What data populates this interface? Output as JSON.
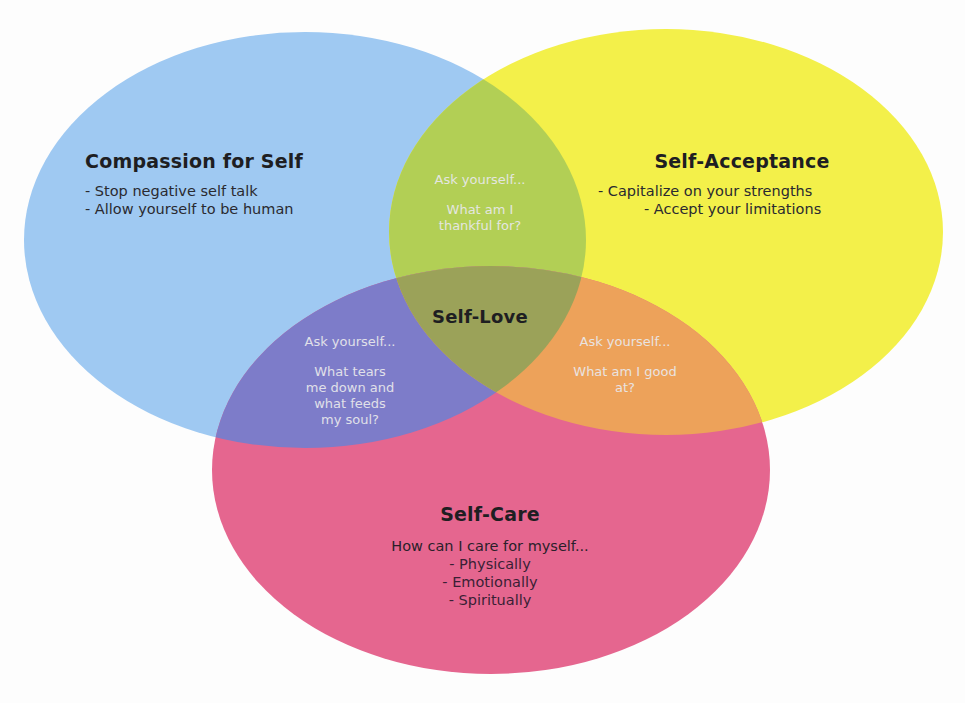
{
  "colors": {
    "background": "#fdfdfd",
    "compassion": "#9fc9f2",
    "acceptance": "#f3f04a",
    "care": "#e5668f",
    "compassion_acceptance": "#b2cf55",
    "compassion_care": "#7d7cc9",
    "acceptance_care": "#eda25a",
    "center": "#9ba259"
  },
  "sets": {
    "compassion": {
      "title": "Compassion for Self",
      "items": [
        "- Stop negative self talk",
        "- Allow yourself to be human"
      ]
    },
    "acceptance": {
      "title": "Self-Acceptance",
      "items": [
        "- Capitalize on your strengths",
        "- Accept your limitations"
      ]
    },
    "care": {
      "title": "Self-Care",
      "lead": "How can I care for myself...",
      "items": [
        "- Physically",
        "- Emotionally",
        "- Spiritually"
      ]
    }
  },
  "intersections": {
    "compassion_acceptance": {
      "prompt": "Ask yourself...",
      "question_lines": [
        "What am I",
        "thankful for?"
      ]
    },
    "compassion_care": {
      "prompt": "Ask yourself...",
      "question_lines": [
        "What tears",
        "me down and",
        "what feeds",
        "my soul?"
      ]
    },
    "acceptance_care": {
      "prompt": "Ask yourself...",
      "question_lines": [
        "What am I good",
        "at?"
      ]
    },
    "center": {
      "title": "Self-Love"
    }
  }
}
